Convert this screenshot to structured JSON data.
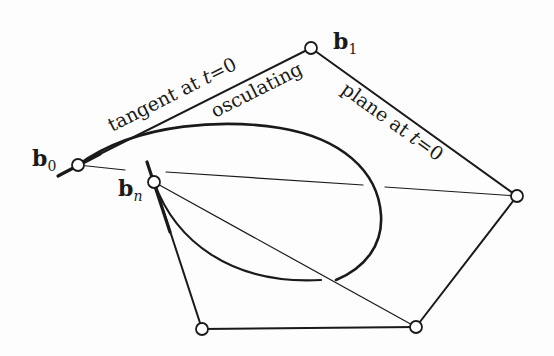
{
  "diagram": {
    "colors": {
      "ink": "#1a1a1a",
      "background": "#fdfdfd",
      "vertex_fill": "#ffffff"
    },
    "vertices": [
      {
        "id": "b0",
        "label_base": "b",
        "label_sub": "0",
        "x": 78,
        "y": 165
      },
      {
        "id": "b1",
        "label_base": "b",
        "label_sub": "1",
        "x": 311,
        "y": 48
      },
      {
        "id": "b2",
        "x": 517,
        "y": 196
      },
      {
        "id": "b3",
        "x": 416,
        "y": 327
      },
      {
        "id": "b4",
        "x": 202,
        "y": 329
      },
      {
        "id": "bn",
        "label_base": "b",
        "label_sub": "n",
        "x": 154,
        "y": 182
      }
    ],
    "labels": {
      "b0_base": "b",
      "b0_sub": "0",
      "b1_base": "b",
      "b1_sub": "1",
      "bn_base": "b",
      "bn_sub": "n",
      "tangent_text": "tangent at ",
      "tangent_t": "t",
      "tangent_eq": "=0",
      "osculating": "osculating",
      "plane_text": "plane at ",
      "plane_t": "t",
      "plane_eq": "=0"
    }
  }
}
